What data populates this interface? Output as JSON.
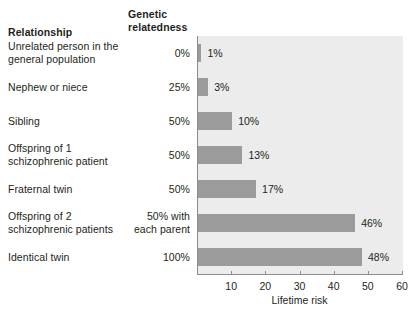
{
  "table": {
    "header_relationship": "Relationship",
    "header_genetic": "Genetic relatedness"
  },
  "chart_data": {
    "type": "bar",
    "orientation": "horizontal",
    "title": "",
    "xlabel": "Lifetime risk",
    "ylabel": "",
    "xlim": [
      0,
      60
    ],
    "xticks": [
      10,
      20,
      30,
      40,
      50,
      60
    ],
    "xtick_labels": [
      "10",
      "20",
      "30",
      "40",
      "50",
      "60"
    ],
    "grid": false,
    "legend": "none",
    "bar_color": "#9b9b9b",
    "plot_background": "#ececec",
    "categories": [
      "Unrelated person in the general population",
      "Nephew or niece",
      "Sibling",
      "Offspring of 1 schizophrenic patient",
      "Fraternal twin",
      "Offspring of 2 schizophrenic patients",
      "Identical twin"
    ],
    "values": [
      1,
      3,
      10,
      13,
      17,
      46,
      48
    ],
    "value_labels": [
      "1%",
      "3%",
      "10%",
      "13%",
      "17%",
      "46%",
      "48%"
    ],
    "genetic_relatedness": [
      "0%",
      "25%",
      "50%",
      "50%",
      "50%",
      "50% with each parent",
      "100%"
    ]
  },
  "rows": [
    {
      "label_line1": "Unrelated person in the",
      "label_line2": "general population",
      "relatedness_line1": "0%",
      "relatedness_line2": "",
      "value_label": "1%"
    },
    {
      "label_line1": "Nephew or niece",
      "label_line2": "",
      "relatedness_line1": "25%",
      "relatedness_line2": "",
      "value_label": "3%"
    },
    {
      "label_line1": "Sibling",
      "label_line2": "",
      "relatedness_line1": "50%",
      "relatedness_line2": "",
      "value_label": "10%"
    },
    {
      "label_line1": "Offspring of 1",
      "label_line2": "schizophrenic patient",
      "relatedness_line1": "50%",
      "relatedness_line2": "",
      "value_label": "13%"
    },
    {
      "label_line1": "Fraternal twin",
      "label_line2": "",
      "relatedness_line1": "50%",
      "relatedness_line2": "",
      "value_label": "17%"
    },
    {
      "label_line1": "Offspring of 2",
      "label_line2": "schizophrenic patients",
      "relatedness_line1": "50% with",
      "relatedness_line2": "each parent",
      "value_label": "46%"
    },
    {
      "label_line1": "Identical twin",
      "label_line2": "",
      "relatedness_line1": "100%",
      "relatedness_line2": "",
      "value_label": "48%"
    }
  ]
}
